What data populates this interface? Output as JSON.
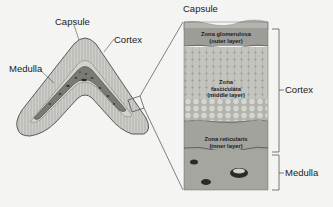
{
  "diagram": {
    "left_labels": {
      "capsule": "Capsule",
      "cortex": "Cortex",
      "medulla": "Medulla"
    },
    "right_labels": {
      "capsule": "Capsule",
      "cortex": "Cortex",
      "medulla": "Medulla"
    },
    "zones": [
      {
        "name": "Zona glomerulosa",
        "sub": "(outer layer)"
      },
      {
        "name": "Zona fasciculata",
        "name_line2": "fasciculata",
        "name_line1": "Zona",
        "sub": "(middle layer)"
      },
      {
        "name": "Zona reticularis",
        "sub": "(inner layer)"
      }
    ],
    "colors": {
      "background": "#f4f4f2",
      "cortex_fill": "#c9c9c4",
      "medulla_fill": "#7a7a76",
      "capsule_fill": "#a8a8a2",
      "glomerulosa_fill": "#9d9d98",
      "fasciculata_fill": "#c2c2bd",
      "reticularis_fill": "#a3a39e",
      "medulla_panel_fill": "#a6a6a1"
    }
  }
}
